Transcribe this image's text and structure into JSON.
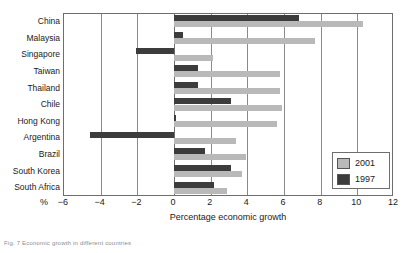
{
  "chart_data": {
    "type": "bar",
    "orientation": "horizontal",
    "title": "",
    "xlabel": "Percentage economic growth",
    "ylabel": "",
    "x_unit_symbol": "%",
    "xlim": [
      -6,
      12
    ],
    "xticks": [
      -6,
      -4,
      -2,
      0,
      2,
      4,
      6,
      8,
      10,
      12
    ],
    "xticklabels": [
      "−6",
      "−4",
      "−2",
      "0",
      "2",
      "4",
      "6",
      "8",
      "10",
      "12"
    ],
    "grid": true,
    "grid_axis": "x",
    "legend_position": "lower right",
    "categories": [
      "China",
      "Malaysia",
      "Singapore",
      "Taiwan",
      "Thailand",
      "Chile",
      "Hong Kong",
      "Argentina",
      "Brazil",
      "South Korea",
      "South Africa"
    ],
    "series": [
      {
        "name": "2001",
        "color": "#b9b9b9",
        "values": [
          10.3,
          7.7,
          2.1,
          5.8,
          5.8,
          5.9,
          5.6,
          3.4,
          3.9,
          3.7,
          2.9
        ]
      },
      {
        "name": "1997",
        "color": "#3c3c3c",
        "values": [
          6.8,
          0.5,
          -2.1,
          1.3,
          1.3,
          3.1,
          0.1,
          -4.6,
          1.7,
          3.1,
          2.2
        ]
      }
    ]
  },
  "legend": {
    "entries": [
      {
        "label": "2001",
        "swatch": "y2001"
      },
      {
        "label": "1997",
        "swatch": "y1997"
      }
    ]
  },
  "caption": {
    "text": "Fig. 7  Economic growth in different countries"
  },
  "colors": {
    "series_2001": "#b9b9b9",
    "series_1997": "#3c3c3c",
    "frame": "#6e6e6e",
    "gridline": "#8a8a8a",
    "text": "#1a1a1a",
    "background": "#ffffff"
  }
}
